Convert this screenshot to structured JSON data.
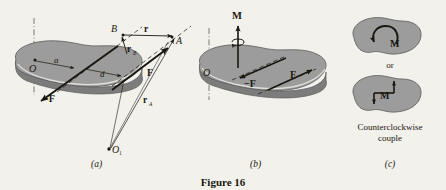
{
  "figure": {
    "caption": "Figure 16",
    "background_color": "#f3f1ec",
    "body_fill_color": "#9c9c9c",
    "body_edge_color": "#6e6e6e",
    "ink_color": "#19170f"
  },
  "panels": [
    {
      "id": "a",
      "label": "(a)",
      "description": "Rigid body acted on by a couple, with position vectors from O1",
      "labels": {
        "point_o": "O",
        "point_o1": "O",
        "point_o1_sub": "1",
        "point_a": "A",
        "point_b": "B",
        "dist_a": "a",
        "dist_d": "d",
        "vec_r": "r",
        "vec_rb": "r",
        "vec_rb_sub": "B",
        "vec_ra": "r",
        "vec_ra_sub": "A",
        "force_f": "F",
        "force_neg_f": "−F"
      }
    },
    {
      "id": "b",
      "label": "(b)",
      "description": "Same body showing the equivalent couple moment vector M along the axis",
      "labels": {
        "point_o": "O",
        "moment_m": "M",
        "force_f": "F",
        "force_neg_f": "−F"
      }
    },
    {
      "id": "c",
      "label": "(c)",
      "description": "Two-dimensional representations of a counterclockwise couple",
      "labels": {
        "moment_m_curved": "M",
        "moment_m_pair": "M",
        "or": "or",
        "note_line1": "Counterclockwise",
        "note_line2": "couple"
      }
    }
  ]
}
